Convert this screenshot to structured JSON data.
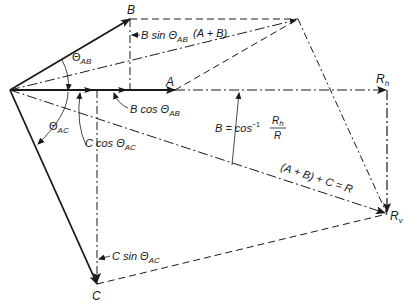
{
  "diagram": {
    "colors": {
      "line": "#1a1a1a",
      "background": "#ffffff"
    },
    "points": {
      "origin": [
        10,
        90
      ],
      "B": [
        130,
        19
      ],
      "A_head": [
        175,
        90
      ],
      "AB_sum": [
        298,
        19
      ],
      "Rh": [
        387,
        90
      ],
      "Rv": [
        387,
        214
      ],
      "C": [
        97,
        284
      ],
      "B_proj": [
        130,
        90
      ],
      "C_proj": [
        97,
        90
      ]
    },
    "labels": {
      "B": "B",
      "A": "A",
      "C": "C",
      "Rh": "R",
      "Rh_sub": "h",
      "Rv": "R",
      "Rv_sub": "v",
      "B_sin_main": "B sin Θ",
      "B_sin_sub": "AB",
      "A_plus_B": "(A + B)",
      "B_cos_main": "B cos Θ",
      "B_cos_sub": "AB",
      "theta_AB_main": "Θ",
      "theta_AB_sub": "AB",
      "theta_AC_main": "Θ",
      "theta_AC_sub": "AC",
      "C_cos_main": "C cos Θ",
      "C_cos_sub": "AC",
      "C_sin_main": "C sin Θ",
      "C_sin_sub": "AC",
      "angle_eq_prefix": "B = cos",
      "angle_eq_exp": "−1",
      "angle_eq_num": "R",
      "angle_eq_num_sub": "h",
      "angle_eq_den": "R",
      "resultant_eq": "(A + B) + C = R"
    }
  }
}
